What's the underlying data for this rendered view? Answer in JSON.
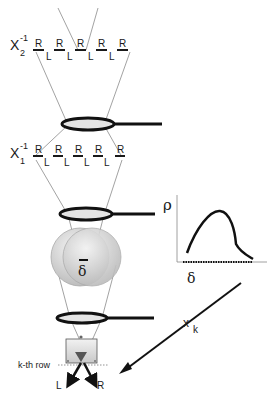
{
  "diagram": {
    "stage2": {
      "operator_label": "X",
      "operator_sub": "2",
      "operator_sup": "-1",
      "top_labels": [
        "R",
        "R",
        "R",
        "R",
        "R"
      ],
      "bottom_labels": [
        "L",
        "L",
        "L",
        "L"
      ]
    },
    "stage1": {
      "operator_label": "X",
      "operator_sub": "1",
      "operator_sup": "-1",
      "top_labels": [
        "R",
        "R",
        "R",
        "R",
        "R"
      ],
      "bottom_labels": [
        "L",
        "L",
        "L",
        "L"
      ]
    },
    "sphere_label": "δ",
    "plot": {
      "y_label": "ρ",
      "x_label": "δ"
    },
    "arrow_label": "x",
    "arrow_sub": "k",
    "row_label": "k-th row",
    "output_left": "L",
    "output_right": "R",
    "colors": {
      "ink": "#1a1a1a",
      "beam": "#8a8a8a",
      "sphere": "#d6d6d6",
      "lens_fill": "#e4e4e4"
    }
  }
}
